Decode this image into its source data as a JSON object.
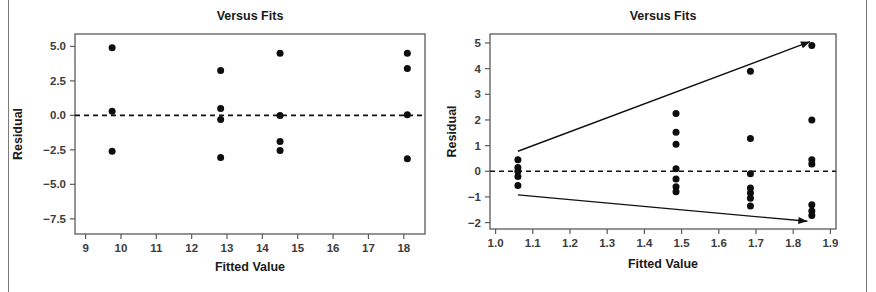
{
  "figure": {
    "background_color": "#ffffff",
    "frame_color": "#7a7a7a",
    "point_color": "#0d0d0d",
    "axis_color": "#5a5a5a",
    "line_color": "#111111"
  },
  "chart_data": [
    {
      "type": "scatter",
      "id": "left",
      "title": "Versus Fits",
      "xlabel": "Fitted Value",
      "ylabel": "Residual",
      "xlim": [
        8.7,
        18.6
      ],
      "ylim": [
        -8.6,
        5.9
      ],
      "xticks": [
        9,
        10,
        11,
        12,
        13,
        14,
        15,
        16,
        17,
        18
      ],
      "xtick_labels": [
        "9",
        "10",
        "11",
        "12",
        "13",
        "14",
        "15",
        "16",
        "17",
        "18"
      ],
      "yticks": [
        5.0,
        2.5,
        0.0,
        -2.5,
        -5.0,
        -7.5
      ],
      "ytick_labels": [
        "5.0",
        "2.5",
        "0.0",
        "-2.5",
        "-5.0",
        "-7.5"
      ],
      "grid": false,
      "legend": null,
      "reference_lines": [
        {
          "name": "zero-residual-line",
          "style": "dashed",
          "y": 0.0
        }
      ],
      "points": [
        {
          "x": 9.75,
          "y": 4.9
        },
        {
          "x": 9.75,
          "y": 0.3
        },
        {
          "x": 9.75,
          "y": -2.6
        },
        {
          "x": 12.82,
          "y": 3.25
        },
        {
          "x": 12.82,
          "y": 0.5
        },
        {
          "x": 12.82,
          "y": -0.3
        },
        {
          "x": 12.82,
          "y": -3.05
        },
        {
          "x": 14.5,
          "y": 4.5
        },
        {
          "x": 14.5,
          "y": 0.0
        },
        {
          "x": 14.5,
          "y": -1.9
        },
        {
          "x": 14.5,
          "y": -2.55
        },
        {
          "x": 18.1,
          "y": 4.5
        },
        {
          "x": 18.1,
          "y": 3.4
        },
        {
          "x": 18.1,
          "y": 0.05
        },
        {
          "x": 18.1,
          "y": -3.15
        }
      ]
    },
    {
      "type": "scatter",
      "id": "right",
      "title": "Versus Fits",
      "xlabel": "Fitted Value",
      "ylabel": "Residual",
      "xlim": [
        0.985,
        1.915
      ],
      "ylim": [
        -2.25,
        5.35
      ],
      "xticks": [
        1.0,
        1.1,
        1.2,
        1.3,
        1.4,
        1.5,
        1.6,
        1.7,
        1.8,
        1.9
      ],
      "xtick_labels": [
        "1.0",
        "1.1",
        "1.2",
        "1.3",
        "1.4",
        "1.5",
        "1.6",
        "1.7",
        "1.8",
        "1.9"
      ],
      "yticks": [
        5,
        4,
        3,
        2,
        1,
        0,
        -1,
        -2
      ],
      "ytick_labels": [
        "5",
        "4",
        "3",
        "2",
        "1",
        "0",
        "-1",
        "-2"
      ],
      "grid": false,
      "legend": null,
      "reference_lines": [
        {
          "name": "zero-residual-line",
          "style": "dashed",
          "y": 0.0
        },
        {
          "name": "upper-funnel-line",
          "style": "solid-arrow",
          "x1": 1.06,
          "y1": 0.78,
          "x2": 1.845,
          "y2": 5.05
        },
        {
          "name": "lower-funnel-line",
          "style": "solid-arrow",
          "x1": 1.06,
          "y1": -0.92,
          "x2": 1.838,
          "y2": -1.95
        }
      ],
      "points": [
        {
          "x": 1.06,
          "y": 0.45
        },
        {
          "x": 1.06,
          "y": 0.15
        },
        {
          "x": 1.06,
          "y": 0.0
        },
        {
          "x": 1.06,
          "y": -0.2
        },
        {
          "x": 1.06,
          "y": -0.55
        },
        {
          "x": 1.485,
          "y": 2.25
        },
        {
          "x": 1.485,
          "y": 1.52
        },
        {
          "x": 1.485,
          "y": 1.05
        },
        {
          "x": 1.485,
          "y": 0.1
        },
        {
          "x": 1.485,
          "y": -0.3
        },
        {
          "x": 1.485,
          "y": -0.6
        },
        {
          "x": 1.485,
          "y": -0.8
        },
        {
          "x": 1.685,
          "y": 3.9
        },
        {
          "x": 1.685,
          "y": 1.28
        },
        {
          "x": 1.685,
          "y": -0.1
        },
        {
          "x": 1.685,
          "y": -0.65
        },
        {
          "x": 1.685,
          "y": -0.85
        },
        {
          "x": 1.685,
          "y": -1.05
        },
        {
          "x": 1.685,
          "y": -1.35
        },
        {
          "x": 1.85,
          "y": 4.9
        },
        {
          "x": 1.85,
          "y": 2.0
        },
        {
          "x": 1.85,
          "y": 0.45
        },
        {
          "x": 1.85,
          "y": 0.28
        },
        {
          "x": 1.85,
          "y": -1.3
        },
        {
          "x": 1.85,
          "y": -1.55
        },
        {
          "x": 1.85,
          "y": -1.72
        }
      ]
    }
  ]
}
